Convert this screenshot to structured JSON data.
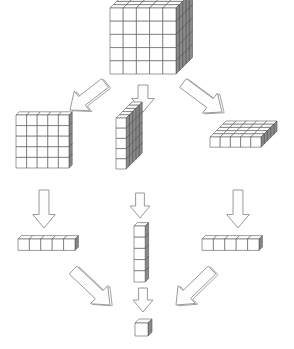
{
  "diagram": {
    "background_color": "#ffffff",
    "stroke_color": "#4a4a4a",
    "face_top_color": "#ffffff",
    "face_front_color": "#ffffff",
    "face_side_color": "#8a8a8a",
    "arrow_stroke_color": "#9a9a9a",
    "arrow_fill_color": "#fdfdfd",
    "base": 5,
    "levels": [
      {
        "name": "cube-level",
        "label": "thousands cube",
        "value": 125,
        "blocks": [
          {
            "name": "big-cube",
            "shape": "5x5x5",
            "dims": [
              5,
              5,
              5
            ],
            "unit_count": 125,
            "origin": [
              110,
              8
            ],
            "cell": 13.2,
            "depth": 3.3
          }
        ]
      },
      {
        "name": "flat-level",
        "label": "flats",
        "value": 25,
        "blocks": [
          {
            "name": "flat-front",
            "shape": "5x5x1",
            "dims": [
              5,
              5,
              1
            ],
            "unit_count": 25,
            "origin": [
              16,
              115
            ],
            "cell": 10.6,
            "depth": 3.2
          },
          {
            "name": "flat-wall",
            "shape": "1x5x5",
            "dims": [
              1,
              5,
              5
            ],
            "unit_count": 25,
            "origin": [
              116,
              118
            ],
            "cell": 10.2,
            "depth": 3.2
          },
          {
            "name": "flat-ground",
            "shape": "5x1x5",
            "dims": [
              5,
              1,
              5
            ],
            "unit_count": 25,
            "origin": [
              210,
              137
            ],
            "cell": 10.2,
            "depth": 3.2
          }
        ]
      },
      {
        "name": "rod-level",
        "label": "rods",
        "value": 5,
        "blocks": [
          {
            "name": "rod-left",
            "shape": "5x1x1",
            "dims": [
              5,
              1,
              1
            ],
            "unit_count": 5,
            "origin": [
              18,
              239
            ],
            "cell": 11.4,
            "depth": 3.4
          },
          {
            "name": "rod-middle",
            "shape": "1x5x1",
            "dims": [
              1,
              5,
              1
            ],
            "unit_count": 5,
            "origin": [
              134,
              226
            ],
            "cell": 11.2,
            "depth": 3.4
          },
          {
            "name": "rod-right",
            "shape": "5x1x1",
            "dims": [
              5,
              1,
              1
            ],
            "unit_count": 5,
            "origin": [
              202,
              239
            ],
            "cell": 11.4,
            "depth": 3.4
          }
        ]
      },
      {
        "name": "unit-level",
        "label": "unit",
        "value": 1,
        "blocks": [
          {
            "name": "unit-cube",
            "shape": "1x1x1",
            "dims": [
              1,
              1,
              1
            ],
            "unit_count": 1,
            "origin": [
              135,
              323
            ],
            "cell": 13.0,
            "depth": 4.0
          }
        ]
      }
    ],
    "arrows": [
      {
        "name": "arrow-cube-to-flat-left",
        "style": "block-3d",
        "from": "big-cube",
        "to": "flat-front",
        "x1": 105,
        "y1": 83,
        "x2": 70,
        "y2": 110,
        "width": 10
      },
      {
        "name": "arrow-cube-to-flat-middle",
        "style": "outline",
        "from": "big-cube",
        "to": "flat-wall",
        "x1": 143,
        "y1": 85,
        "x2": 143,
        "y2": 112,
        "width": 9
      },
      {
        "name": "arrow-cube-to-flat-right",
        "style": "block-3d",
        "from": "big-cube",
        "to": "flat-ground",
        "x1": 183,
        "y1": 83,
        "x2": 222,
        "y2": 112,
        "width": 10
      },
      {
        "name": "arrow-flat-to-rod-left",
        "style": "outline",
        "from": "flat-front",
        "to": "rod-left",
        "x1": 44,
        "y1": 190,
        "x2": 44,
        "y2": 228,
        "width": 9
      },
      {
        "name": "arrow-flat-to-rod-middle",
        "style": "outline",
        "from": "flat-wall",
        "to": "rod-middle",
        "x1": 140,
        "y1": 193,
        "x2": 140,
        "y2": 218,
        "width": 8
      },
      {
        "name": "arrow-flat-to-rod-right",
        "style": "outline",
        "from": "flat-ground",
        "to": "rod-right",
        "x1": 238,
        "y1": 190,
        "x2": 238,
        "y2": 228,
        "width": 9
      },
      {
        "name": "arrow-rod-to-unit-left",
        "style": "block-3d",
        "from": "rod-left",
        "to": "unit-cube",
        "x1": 73,
        "y1": 270,
        "x2": 110,
        "y2": 305,
        "width": 10
      },
      {
        "name": "arrow-rod-to-unit-middle",
        "style": "outline",
        "from": "rod-middle",
        "to": "unit-cube",
        "x1": 143,
        "y1": 288,
        "x2": 143,
        "y2": 312,
        "width": 8
      },
      {
        "name": "arrow-rod-to-unit-right",
        "style": "block-3d",
        "from": "rod-right",
        "to": "unit-cube",
        "x1": 212,
        "y1": 270,
        "x2": 176,
        "y2": 305,
        "width": 10
      }
    ]
  }
}
